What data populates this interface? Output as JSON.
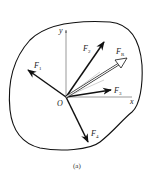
{
  "figure": {
    "caption": "(a)",
    "origin_label": "O",
    "axes": {
      "x_label": "x",
      "y_label": "y"
    },
    "forces": [
      {
        "id": "F1",
        "symbol": "F",
        "subscript": "1",
        "style": "solid"
      },
      {
        "id": "F2",
        "symbol": "F",
        "subscript": "2",
        "style": "solid"
      },
      {
        "id": "F3",
        "symbol": "F",
        "subscript": "3",
        "style": "solid"
      },
      {
        "id": "F4",
        "symbol": "F",
        "subscript": "4",
        "style": "solid"
      },
      {
        "id": "FR",
        "symbol": "F",
        "subscript": "R",
        "style": "hollow"
      }
    ],
    "colors": {
      "stroke": "#111111",
      "axis": "#555555",
      "background": "#ffffff"
    }
  }
}
